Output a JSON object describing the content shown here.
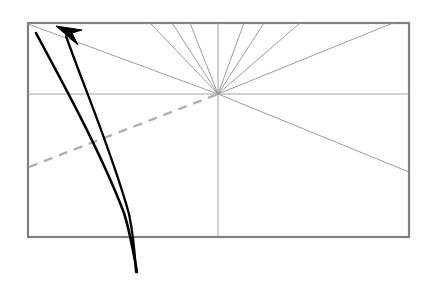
{
  "figure": {
    "title": "",
    "canvas": {
      "width": 428,
      "height": 283,
      "background": "#ffffff"
    },
    "colors": {
      "frame": "#808080",
      "ray": "#8c8c8c",
      "axis": "#9a9a9a",
      "dashed": "#b0b0b0",
      "curve": "#000000"
    },
    "frame": {
      "label": "bounding-rectangle",
      "x": 28,
      "y": 23,
      "width": 381,
      "height": 214,
      "stroke_width": 2.2
    },
    "origin": {
      "label": "ray-convergence-point",
      "x": 218,
      "y": 94
    },
    "axes": {
      "horizontal": {
        "label": "horizontal-axis",
        "x1": 28,
        "y1": 94,
        "x2": 409,
        "y2": 94
      },
      "vertical": {
        "label": "vertical-axis",
        "x1": 218,
        "y1": 94,
        "x2": 218,
        "y2": 237
      }
    },
    "rays": [
      {
        "id": "ray-1",
        "x": 28,
        "y": 24
      },
      {
        "id": "ray-2",
        "x": 150,
        "y": 23
      },
      {
        "id": "ray-3",
        "x": 172,
        "y": 23
      },
      {
        "id": "ray-4",
        "x": 190,
        "y": 23
      },
      {
        "id": "ray-5",
        "x": 218,
        "y": 23
      },
      {
        "id": "ray-6",
        "x": 244,
        "y": 23
      },
      {
        "id": "ray-7",
        "x": 264,
        "y": 23
      },
      {
        "id": "ray-8",
        "x": 300,
        "y": 23
      },
      {
        "id": "ray-9",
        "x": 393,
        "y": 23
      },
      {
        "id": "ray-10",
        "x": 409,
        "y": 172
      }
    ],
    "dashed_line": {
      "label": "dashed-reference-line",
      "x1": 29,
      "y1": 167,
      "x2": 218,
      "y2": 94,
      "dash_pattern": "9 7",
      "stroke_width": 2.4
    },
    "curve_outer": {
      "label": "outer-trajectory-curve",
      "path": "M 36 33 C 60 78, 100 150, 124 213 C 130 232, 134 255, 137 272"
    },
    "curve_inner": {
      "label": "inner-trajectory-curve",
      "path": "M 66 36 C 82 82, 112 152, 129 214 C 133 233, 135 255, 136 272"
    },
    "arrow": {
      "label": "arrowhead",
      "tip_x": 56,
      "tip_y": 26,
      "points": "56,26 78,45 72,33 82,30"
    }
  }
}
